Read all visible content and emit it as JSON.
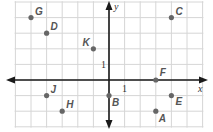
{
  "figure": {
    "type": "coordinate-plane",
    "x_axis_label": "x",
    "y_axis_label": "y",
    "x_tick_label": "1",
    "y_tick_label": "1",
    "x_range": [
      -6,
      6
    ],
    "y_range": [
      -3,
      5
    ],
    "grid_step": 1,
    "colors": {
      "grid": "#d6d6d6",
      "axis": "#1a1a1a",
      "point": "#666666",
      "label": "#555555"
    }
  },
  "points": [
    {
      "name": "A",
      "x": 3,
      "y": -2
    },
    {
      "name": "B",
      "x": 0,
      "y": -1
    },
    {
      "name": "C",
      "x": 4,
      "y": 4
    },
    {
      "name": "D",
      "x": -4,
      "y": 3
    },
    {
      "name": "E",
      "x": 4,
      "y": -1
    },
    {
      "name": "F",
      "x": 3,
      "y": 0
    },
    {
      "name": "G",
      "x": -5,
      "y": 4
    },
    {
      "name": "H",
      "x": -3,
      "y": -2
    },
    {
      "name": "J",
      "x": -4,
      "y": -1
    },
    {
      "name": "K",
      "x": -1,
      "y": 2
    }
  ]
}
